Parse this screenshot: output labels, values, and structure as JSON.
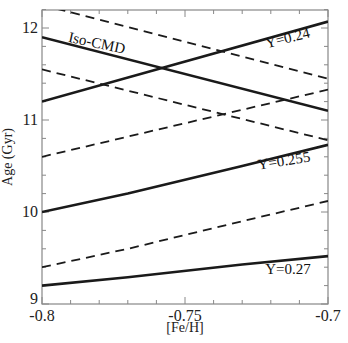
{
  "chart_data": {
    "type": "line",
    "title": "",
    "xlabel": "[Fe/H]",
    "ylabel": "Age (Gyr)",
    "xlim": [
      -0.8,
      -0.7
    ],
    "ylim": [
      9.0,
      12.2
    ],
    "xticks": [
      -0.8,
      -0.75,
      -0.7
    ],
    "xtick_labels": [
      "-0.8",
      "-0.75",
      "-0.7"
    ],
    "yticks": [
      9,
      10,
      11,
      12
    ],
    "ytick_labels": [
      "9",
      "10",
      "11",
      "12"
    ],
    "grid": false,
    "legend": null,
    "series": [
      {
        "name": "Y=0.24 solid (increasing)",
        "style": "solid",
        "x": [
          -0.8,
          -0.7
        ],
        "y": [
          11.2,
          12.07
        ]
      },
      {
        "name": "Y=0.24 dashed (decreasing)",
        "style": "dashed",
        "x": [
          -0.8,
          -0.7
        ],
        "y": [
          12.25,
          11.45
        ]
      },
      {
        "name": "Iso-CMD Y=0.24 solid (decreasing)",
        "style": "solid",
        "x": [
          -0.8,
          -0.7
        ],
        "y": [
          11.9,
          11.1
        ]
      },
      {
        "name": "Iso-CMD dashed (decreasing)",
        "style": "dashed",
        "x": [
          -0.8,
          -0.7
        ],
        "y": [
          11.55,
          10.78
        ]
      },
      {
        "name": "Y=0.24 dashed (increasing)",
        "style": "dashed",
        "x": [
          -0.8,
          -0.7
        ],
        "y": [
          10.6,
          11.33
        ]
      },
      {
        "name": "Y=0.255 solid",
        "style": "solid",
        "x": [
          -0.8,
          -0.77,
          -0.73,
          -0.7
        ],
        "y": [
          10.0,
          10.2,
          10.5,
          10.73
        ]
      },
      {
        "name": "Y=0.255 dashed",
        "style": "dashed",
        "x": [
          -0.8,
          -0.77,
          -0.73,
          -0.7
        ],
        "y": [
          9.4,
          9.6,
          9.9,
          10.12
        ]
      },
      {
        "name": "Y=0.27 solid",
        "style": "solid",
        "x": [
          -0.8,
          -0.77,
          -0.73,
          -0.7
        ],
        "y": [
          9.2,
          9.29,
          9.43,
          9.52
        ]
      }
    ],
    "annotations": [
      {
        "text": "Iso-CMD",
        "x": -0.791,
        "y": 11.85
      },
      {
        "text": "Y=0.24",
        "x": -0.706,
        "y": 11.9
      },
      {
        "text": "Y=0.255",
        "x": -0.706,
        "y": 10.55
      },
      {
        "text": "Y=0.27",
        "x": -0.706,
        "y": 9.33
      }
    ]
  }
}
